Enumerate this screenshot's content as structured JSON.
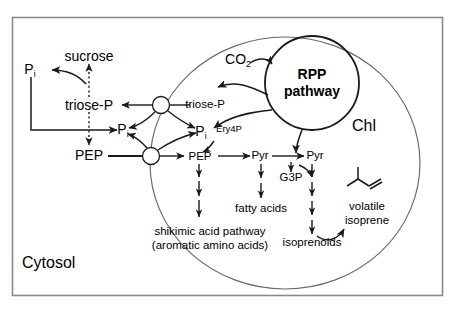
{
  "diagram": {
    "title_regions": {
      "cytosol_label": "Cytosol",
      "chloroplast_label": "Chl"
    },
    "cytosol": {
      "sucrose": "sucrose",
      "triose_p": "triose-P",
      "pep": "PEP",
      "pi_upper": "P",
      "pi_upper_sub": "i",
      "pi_mid": "P",
      "pi_mid_sub": "i"
    },
    "stroma": {
      "triose_p": "triose-P",
      "pi": "P",
      "pi_sub": "i",
      "pep": "PEP",
      "ery4p": "Ery4P",
      "co2": "CO",
      "co2_sub": "2",
      "rpp_line1": "RPP",
      "rpp_line2": "pathway",
      "pyr_left": "Pyr",
      "pyr_right": "Pyr",
      "g3p": "G3P",
      "isoprenoids": "isoprenoids",
      "volatile_line1": "volatile",
      "volatile_line2": "isoprene"
    },
    "products": {
      "fatty_acids": "fatty acids",
      "shikimic_line1": "shikimic acid pathway",
      "shikimic_line2": "(aromatic amino acids)"
    },
    "colors": {
      "stroke": "#1a1a1a",
      "envelope": "#555555",
      "frame": "#8a8a8a",
      "background": "#ffffff"
    }
  }
}
